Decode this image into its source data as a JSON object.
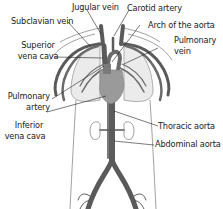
{
  "diagram": {
    "colors": {
      "vessel": "#5a5a5a",
      "vessel_dark": "#3c3c3c",
      "heart": "#9a9a9a",
      "lung": "#e8e8e8",
      "outline": "#888888",
      "label": "#222222",
      "leader": "#222222"
    },
    "labels": {
      "jugular_vein": "Jugular vein",
      "subclavian_vein": "Subclavian vein",
      "superior_vena_cava_1": "Superior",
      "superior_vena_cava_2": "vena cava",
      "pulmonary_artery_1": "Pulmonary",
      "pulmonary_artery_2": "artery",
      "inferior_vena_cava_1": "Inferior",
      "inferior_vena_cava_2": "vena cava",
      "carotid_artery": "Carotid artery",
      "arch_of_aorta": "Arch of the aorta",
      "pulmonary_vein_1": "Pulmonary",
      "pulmonary_vein_2": "vein",
      "thoracic_aorta": "Thoracic aorta",
      "abdominal_aorta": "Abdominal aorta"
    }
  }
}
